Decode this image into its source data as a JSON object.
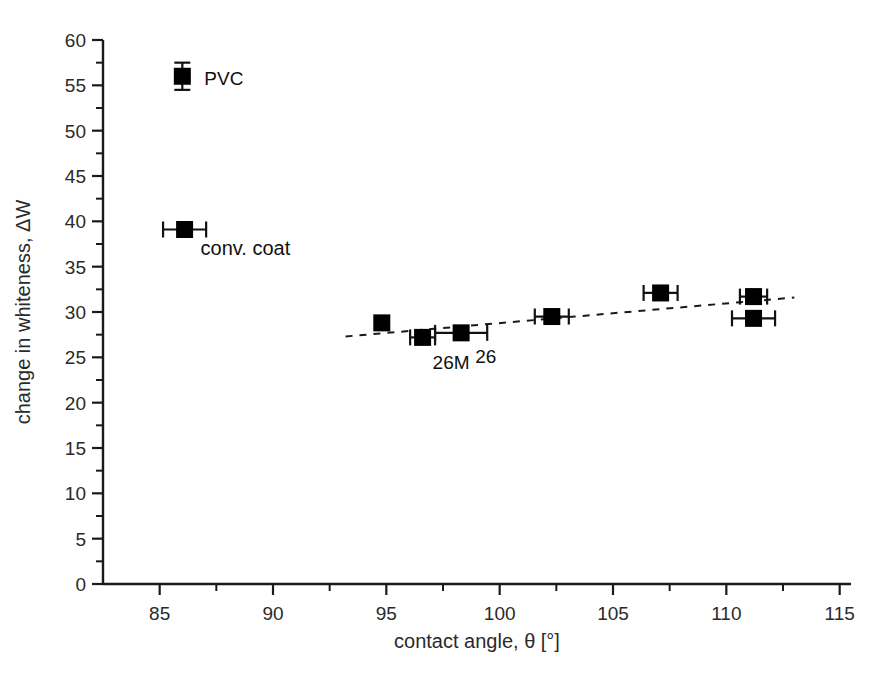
{
  "chart_data": {
    "type": "scatter",
    "title": "",
    "xlabel": "contact angle, θ [°]",
    "ylabel": "change in whiteness, ΔW",
    "xlim": [
      82.5,
      115.5
    ],
    "ylim": [
      0,
      60
    ],
    "xticks": [
      85,
      90,
      95,
      100,
      105,
      110,
      115
    ],
    "yticks": [
      0,
      5,
      10,
      15,
      20,
      25,
      30,
      35,
      40,
      45,
      50,
      55,
      60
    ],
    "minor_ticks": true,
    "grid": false,
    "legend": false,
    "marker": "filled-square",
    "marker_color": "#000000",
    "points": [
      {
        "id": "pvc",
        "x": 86.0,
        "y": 56.0,
        "xerr": 0.0,
        "yerr": 1.5,
        "label": "PVC",
        "label_dx": 22,
        "label_dy": 9
      },
      {
        "id": "conv-coat",
        "x": 86.1,
        "y": 39.1,
        "xerr": 0.95,
        "yerr": 0.0,
        "label": "conv. coat",
        "label_dx": 16,
        "label_dy": 26
      },
      {
        "id": "p1",
        "x": 94.8,
        "y": 28.8,
        "xerr": 0.0,
        "yerr": 0.0,
        "label": "",
        "label_dx": 0,
        "label_dy": 0
      },
      {
        "id": "p2-26m",
        "x": 96.6,
        "y": 27.2,
        "xerr": 0.55,
        "yerr": 0.0,
        "label": "26M",
        "label_dx": 10,
        "label_dy": 32
      },
      {
        "id": "p3-26",
        "x": 98.3,
        "y": 27.7,
        "xerr": 1.15,
        "yerr": 0.0,
        "label": "26",
        "label_dx": 14,
        "label_dy": 30
      },
      {
        "id": "p4",
        "x": 102.3,
        "y": 29.5,
        "xerr": 0.75,
        "yerr": 0.0,
        "label": "",
        "label_dx": 0,
        "label_dy": 0
      },
      {
        "id": "p5",
        "x": 107.1,
        "y": 32.1,
        "xerr": 0.75,
        "yerr": 0.0,
        "label": "",
        "label_dx": 0,
        "label_dy": 0
      },
      {
        "id": "p6",
        "x": 111.2,
        "y": 31.7,
        "xerr": 0.6,
        "yerr": 0.0,
        "label": "",
        "label_dx": 0,
        "label_dy": 0
      },
      {
        "id": "p7",
        "x": 111.2,
        "y": 29.3,
        "xerr": 0.95,
        "yerr": 0.0,
        "label": "",
        "label_dx": 0,
        "label_dy": 0
      }
    ],
    "trendline": {
      "style": "dashed",
      "x_start": 93.2,
      "y_start": 27.3,
      "x_end": 113.0,
      "y_end": 31.6
    }
  }
}
